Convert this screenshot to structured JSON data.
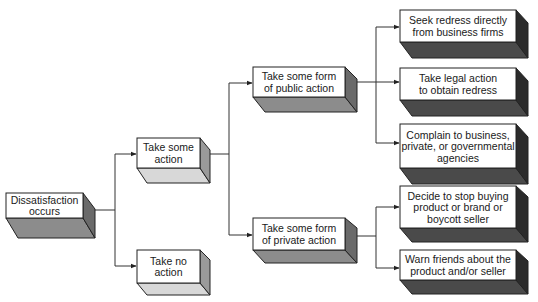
{
  "diagram": {
    "type": "flowchart",
    "nodes": [
      {
        "id": "dissatisfaction",
        "lines": [
          "Dissatisfaction",
          "occurs"
        ]
      },
      {
        "id": "take-action",
        "lines": [
          "Take some",
          "action"
        ]
      },
      {
        "id": "no-action",
        "lines": [
          "Take no",
          "action"
        ]
      },
      {
        "id": "public-action",
        "lines": [
          "Take some form",
          "of public action"
        ]
      },
      {
        "id": "private-action",
        "lines": [
          "Take some form",
          "of private action"
        ]
      },
      {
        "id": "seek-redress",
        "lines": [
          "Seek redress directly",
          "from business firms"
        ]
      },
      {
        "id": "legal-action",
        "lines": [
          "Take legal action",
          "to obtain redress"
        ]
      },
      {
        "id": "complain",
        "lines": [
          "Complain to business,",
          "private, or governmental",
          "agencies"
        ]
      },
      {
        "id": "stop-buying",
        "lines": [
          "Decide to stop buying",
          "product or brand or",
          "boycott seller"
        ]
      },
      {
        "id": "warn-friends",
        "lines": [
          "Warn friends about the",
          "product and/or seller"
        ]
      }
    ],
    "edges": [
      {
        "from": "dissatisfaction",
        "to": "take-action"
      },
      {
        "from": "dissatisfaction",
        "to": "no-action"
      },
      {
        "from": "take-action",
        "to": "public-action"
      },
      {
        "from": "take-action",
        "to": "private-action"
      },
      {
        "from": "public-action",
        "to": "seek-redress"
      },
      {
        "from": "public-action",
        "to": "legal-action"
      },
      {
        "from": "public-action",
        "to": "complain"
      },
      {
        "from": "private-action",
        "to": "stop-buying"
      },
      {
        "from": "private-action",
        "to": "warn-friends"
      }
    ]
  }
}
